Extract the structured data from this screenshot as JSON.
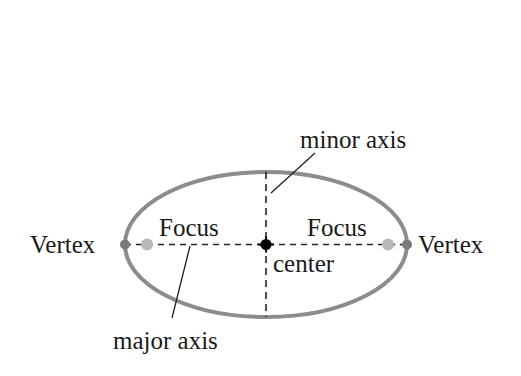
{
  "diagram": {
    "type": "ellipse-anatomy",
    "labels": {
      "minor_axis": "minor axis",
      "major_axis": "major axis",
      "focus_left": "Focus",
      "focus_right": "Focus",
      "vertex_left": "Vertex",
      "vertex_right": "Vertex",
      "center": "center"
    },
    "colors": {
      "ellipse_stroke": "#8c8c8c",
      "vertex_dot": "#7a7a7a",
      "focus_dot": "#b8b8b8",
      "center_dot": "#000000",
      "axis_dash": "#222222",
      "text": "#1a1a1a"
    }
  }
}
